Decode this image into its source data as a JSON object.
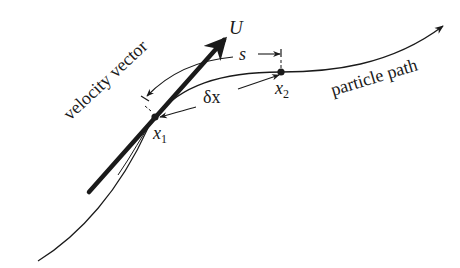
{
  "diagram": {
    "colors": {
      "ink": "#1a1a1a",
      "background": "#ffffff"
    },
    "labels": {
      "velocity_symbol": "U",
      "arc_length": "s",
      "displacement": "δx",
      "point1_base": "x",
      "point1_sub": "1",
      "point2_base": "x",
      "point2_sub": "2",
      "velocity_vector": "velocity vector",
      "particle_path": "particle path"
    },
    "points": [
      {
        "name": "x1",
        "x": 155,
        "y": 117
      },
      {
        "name": "x2",
        "x": 281,
        "y": 72
      }
    ]
  }
}
